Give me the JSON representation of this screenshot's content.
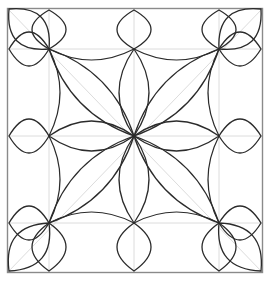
{
  "artwork": {
    "title": "Symmetric Floral Quilting Block",
    "type": "line-drawing",
    "canvas": {
      "width": 271,
      "height": 281
    },
    "background_color": "#ffffff"
  },
  "colors": {
    "frame_stroke": "#8a8a8a",
    "guide_stroke": "#dcdcdc",
    "petal_stroke": "#2b2b2b"
  },
  "frame": {
    "left": 7.5,
    "top": 8.5,
    "right": 262.5,
    "bottom": 272.5
  },
  "grid": {
    "columns_x": [
      49,
      134,
      219
    ],
    "rows_y": [
      49,
      136,
      223
    ],
    "node_labels": [
      "top-left",
      "top-center",
      "top-right",
      "mid-left",
      "center",
      "mid-right",
      "bottom-left",
      "bottom-center",
      "bottom-right"
    ]
  },
  "guide_lines": {
    "description": "light gray straight construction lines",
    "segments": [
      {
        "x1": 49,
        "y1": 8.5,
        "x2": 49,
        "y2": 272.5
      },
      {
        "x1": 134,
        "y1": 8.5,
        "x2": 134,
        "y2": 272.5
      },
      {
        "x1": 219,
        "y1": 8.5,
        "x2": 219,
        "y2": 272.5
      },
      {
        "x1": 7.5,
        "y1": 49,
        "x2": 262.5,
        "y2": 49
      },
      {
        "x1": 7.5,
        "y1": 136,
        "x2": 262.5,
        "y2": 136
      },
      {
        "x1": 7.5,
        "y1": 223,
        "x2": 262.5,
        "y2": 223
      },
      {
        "x1": 7.5,
        "y1": 8.5,
        "x2": 262.5,
        "y2": 272.5
      },
      {
        "x1": 262.5,
        "y1": 8.5,
        "x2": 7.5,
        "y2": 272.5
      }
    ]
  },
  "outer_petals": {
    "description": "dark petals radiating outward from perimeter nodes toward the frame",
    "half_width": 17,
    "items": [
      {
        "node": "top-left",
        "x": 49,
        "y": 49,
        "tip_x": 9,
        "tip_y": 9,
        "direction": "up-left"
      },
      {
        "node": "top-left",
        "x": 49,
        "y": 49,
        "tip_x": 49,
        "tip_y": 10,
        "direction": "up"
      },
      {
        "node": "top-left",
        "x": 49,
        "y": 49,
        "tip_x": 9,
        "tip_y": 49,
        "direction": "left"
      },
      {
        "node": "top-center",
        "x": 134,
        "y": 49,
        "tip_x": 134,
        "tip_y": 10,
        "direction": "up"
      },
      {
        "node": "top-right",
        "x": 219,
        "y": 49,
        "tip_x": 261,
        "tip_y": 9,
        "direction": "up-right"
      },
      {
        "node": "top-right",
        "x": 219,
        "y": 49,
        "tip_x": 219,
        "tip_y": 10,
        "direction": "up"
      },
      {
        "node": "top-right",
        "x": 219,
        "y": 49,
        "tip_x": 261,
        "tip_y": 49,
        "direction": "right"
      },
      {
        "node": "mid-left",
        "x": 49,
        "y": 136,
        "tip_x": 9,
        "tip_y": 136,
        "direction": "left"
      },
      {
        "node": "mid-right",
        "x": 219,
        "y": 136,
        "tip_x": 261,
        "tip_y": 136,
        "direction": "right"
      },
      {
        "node": "bottom-left",
        "x": 49,
        "y": 223,
        "tip_x": 9,
        "tip_y": 271,
        "direction": "down-left"
      },
      {
        "node": "bottom-left",
        "x": 49,
        "y": 223,
        "tip_x": 49,
        "tip_y": 271,
        "direction": "down"
      },
      {
        "node": "bottom-left",
        "x": 49,
        "y": 223,
        "tip_x": 9,
        "tip_y": 223,
        "direction": "left"
      },
      {
        "node": "bottom-center",
        "x": 134,
        "y": 223,
        "tip_x": 134,
        "tip_y": 271,
        "direction": "down"
      },
      {
        "node": "bottom-right",
        "x": 219,
        "y": 223,
        "tip_x": 261,
        "tip_y": 271,
        "direction": "down-right"
      },
      {
        "node": "bottom-right",
        "x": 219,
        "y": 223,
        "tip_x": 219,
        "tip_y": 271,
        "direction": "down"
      },
      {
        "node": "bottom-right",
        "x": 219,
        "y": 223,
        "tip_x": 261,
        "tip_y": 223,
        "direction": "right"
      }
    ]
  },
  "inner_petals": {
    "description": "dark lens/petal shapes running from each perimeter node inward to the center node",
    "half_width": 15,
    "items": [
      {
        "from": "top-left",
        "x1": 49,
        "y1": 49,
        "x2": 134,
        "y2": 136
      },
      {
        "from": "top-center",
        "x1": 134,
        "y1": 49,
        "x2": 134,
        "y2": 136
      },
      {
        "from": "top-right",
        "x1": 219,
        "y1": 49,
        "x2": 134,
        "y2": 136
      },
      {
        "from": "mid-left",
        "x1": 49,
        "y1": 136,
        "x2": 134,
        "y2": 136
      },
      {
        "from": "mid-right",
        "x1": 219,
        "y1": 136,
        "x2": 134,
        "y2": 136
      },
      {
        "from": "bottom-left",
        "x1": 49,
        "y1": 223,
        "x2": 134,
        "y2": 136
      },
      {
        "from": "bottom-center",
        "x1": 134,
        "y1": 223,
        "x2": 134,
        "y2": 136
      },
      {
        "from": "bottom-right",
        "x1": 219,
        "y1": 223,
        "x2": 134,
        "y2": 136
      }
    ]
  },
  "cell_arcs": {
    "description": "dark arcs bowing inward along each inner grid cell edge",
    "bow_depth": 11,
    "items": [
      {
        "x1": 49,
        "y1": 49,
        "x2": 134,
        "y2": 49,
        "bow": "down"
      },
      {
        "x1": 134,
        "y1": 49,
        "x2": 219,
        "y2": 49,
        "bow": "down"
      },
      {
        "x1": 49,
        "y1": 223,
        "x2": 134,
        "y2": 223,
        "bow": "up"
      },
      {
        "x1": 134,
        "y1": 223,
        "x2": 219,
        "y2": 223,
        "bow": "up"
      },
      {
        "x1": 49,
        "y1": 49,
        "x2": 49,
        "y2": 136,
        "bow": "right"
      },
      {
        "x1": 49,
        "y1": 136,
        "x2": 49,
        "y2": 223,
        "bow": "right"
      },
      {
        "x1": 219,
        "y1": 49,
        "x2": 219,
        "y2": 136,
        "bow": "left"
      },
      {
        "x1": 219,
        "y1": 136,
        "x2": 219,
        "y2": 223,
        "bow": "left"
      }
    ]
  }
}
